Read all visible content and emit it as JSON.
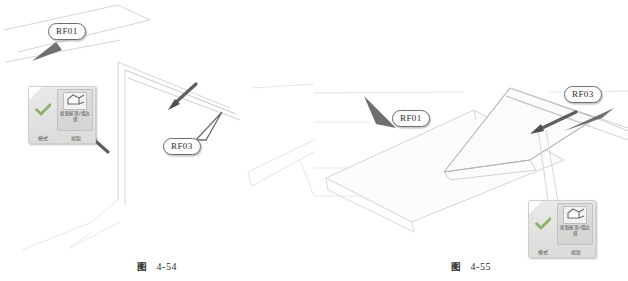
{
  "page": {
    "figures": [
      {
        "id": "fig-4-54",
        "caption_word": "图",
        "caption_number": "4-54",
        "callouts": [
          {
            "name": "callout-rf01",
            "label": "RF01"
          },
          {
            "name": "callout-rf03",
            "label": "RF03"
          }
        ],
        "panel": {
          "icon_name": "pick-roof-wall-edge-icon",
          "button_label": "拾取屋顶/墙边缘",
          "mode_group_label": "模式",
          "pick_group_label": "拾取",
          "check_icon_name": "finish-check-icon"
        },
        "arrows": [
          {
            "name": "annotation-arrow-roof-edge"
          },
          {
            "name": "annotation-arrow-pick-button"
          }
        ]
      },
      {
        "id": "fig-4-55",
        "caption_word": "图",
        "caption_number": "4-55",
        "callouts": [
          {
            "name": "callout-rf01",
            "label": "RF01"
          },
          {
            "name": "callout-rf03",
            "label": "RF03"
          }
        ],
        "panel": {
          "icon_name": "pick-roof-wall-edge-icon",
          "button_label": "拾取屋顶/墙边缘",
          "mode_group_label": "模式",
          "pick_group_label": "拾取",
          "check_icon_name": "finish-check-icon"
        },
        "arrows": [
          {
            "name": "annotation-arrow-roof-ridge"
          }
        ]
      }
    ],
    "colors": {
      "page_background": "#ffffff",
      "model_line": "#c9ccd1",
      "model_line_strong": "#9aa0a6",
      "model_fill": "#fbfbfc",
      "callout_border": "#6d6d6d",
      "arrow": "#5a5a5a",
      "panel_background": "#e4e4e2",
      "check_green": "#7aab54",
      "caption_text": "#2b2b2b"
    }
  }
}
